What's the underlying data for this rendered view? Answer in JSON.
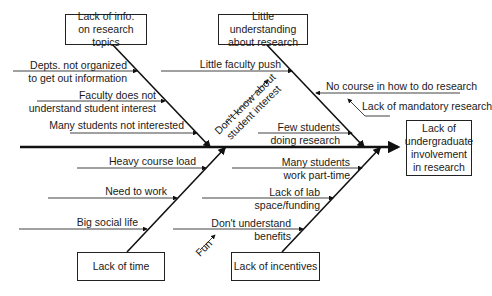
{
  "effect": {
    "label_lines": [
      "Lack of",
      "undergraduate",
      "involvement",
      "in research"
    ]
  },
  "categories": [
    {
      "id": "info",
      "label_lines": [
        "Lack of info.",
        "on research topics"
      ]
    },
    {
      "id": "understanding",
      "label_lines": [
        "Little understanding",
        "about research"
      ]
    },
    {
      "id": "time",
      "label_lines": [
        "Lack of time"
      ]
    },
    {
      "id": "incentives",
      "label_lines": [
        "Lack of incentives"
      ]
    }
  ],
  "causes": {
    "info": [
      [
        "Depts. not organized",
        "to get out information"
      ],
      [
        "Faculty does not",
        "understand student interest"
      ],
      [
        "Many students not interested"
      ]
    ],
    "understanding": [
      [
        "Little faculty push"
      ],
      [
        "No course in how to do research"
      ],
      [
        "Lack of mandatory research"
      ],
      [
        "Few students",
        "doing research"
      ]
    ],
    "time": [
      [
        "Heavy course load"
      ],
      [
        "Need to work"
      ],
      [
        "Big social life"
      ]
    ],
    "incentives": [
      [
        "Many students",
        "work part-time"
      ],
      [
        "Lack of lab",
        "space/funding"
      ],
      [
        "Don't understand",
        "benefits"
      ]
    ]
  },
  "sub_causes": {
    "dont_know": [
      "Don't know about",
      "student interest"
    ],
    "fun": "Fun"
  }
}
